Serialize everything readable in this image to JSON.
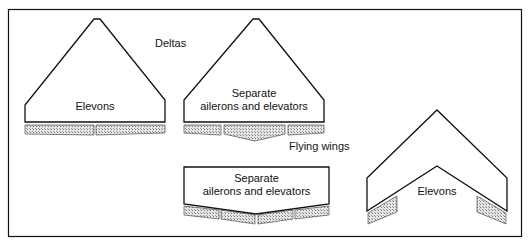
{
  "diagram": {
    "section_labels": {
      "deltas": "Deltas",
      "flying_wings": "Flying wings"
    },
    "shapes": [
      {
        "id": "delta-elevons",
        "label_lines": [
          "Elevons"
        ]
      },
      {
        "id": "delta-separate",
        "label_lines": [
          "Separate",
          "ailerons and elevators"
        ]
      },
      {
        "id": "flyingwing-separate",
        "label_lines": [
          "Separate",
          "ailerons and elevators"
        ]
      },
      {
        "id": "flyingwing-elevons",
        "label_lines": [
          "Elevons"
        ]
      }
    ],
    "colors": {
      "outline": "#111111",
      "surface_fill": "#c8c8c8",
      "background": "#ffffff"
    }
  }
}
